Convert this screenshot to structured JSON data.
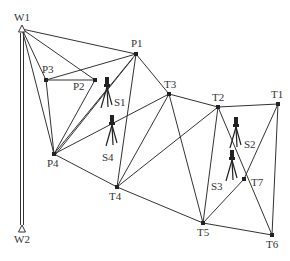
{
  "diagram": {
    "type": "survey-triangulation-network",
    "colors": {
      "line": "#333333",
      "point": "#222222",
      "text": "#333333",
      "background": "#ffffff"
    },
    "benchmarks": [
      {
        "id": "W1",
        "label": "W1",
        "x": 22,
        "y": 29,
        "lx": 14,
        "ly": 21
      },
      {
        "id": "W2",
        "label": "W2",
        "x": 22,
        "y": 229,
        "lx": 14,
        "ly": 243
      }
    ],
    "points": [
      {
        "id": "P1",
        "label": "P1",
        "x": 136,
        "y": 54,
        "lx": 131,
        "ly": 47
      },
      {
        "id": "P2",
        "label": "P2",
        "x": 95,
        "y": 80,
        "lx": 73,
        "ly": 90
      },
      {
        "id": "P3",
        "label": "P3",
        "x": 46,
        "y": 80,
        "lx": 42,
        "ly": 73
      },
      {
        "id": "P4",
        "label": "P4",
        "x": 54,
        "y": 154,
        "lx": 47,
        "ly": 167
      },
      {
        "id": "T1",
        "label": "T1",
        "x": 278,
        "y": 104,
        "lx": 271,
        "ly": 98
      },
      {
        "id": "T2",
        "label": "T2",
        "x": 218,
        "y": 107,
        "lx": 212,
        "ly": 101
      },
      {
        "id": "T3",
        "label": "T3",
        "x": 169,
        "y": 94,
        "lx": 164,
        "ly": 88
      },
      {
        "id": "T4",
        "label": "T4",
        "x": 117,
        "y": 187,
        "lx": 109,
        "ly": 200
      },
      {
        "id": "T5",
        "label": "T5",
        "x": 203,
        "y": 223,
        "lx": 197,
        "ly": 236
      },
      {
        "id": "T6",
        "label": "T6",
        "x": 272,
        "y": 235,
        "lx": 266,
        "ly": 248
      },
      {
        "id": "T7",
        "label": "T7",
        "x": 244,
        "y": 179,
        "lx": 251,
        "ly": 186
      }
    ],
    "stations": [
      {
        "id": "S1",
        "label": "S1",
        "x": 107,
        "y": 84,
        "lx": 114,
        "ly": 106
      },
      {
        "id": "S4",
        "label": "S4",
        "x": 112,
        "y": 122,
        "lx": 102,
        "ly": 161
      },
      {
        "id": "S2",
        "label": "S2",
        "x": 236,
        "y": 124,
        "lx": 244,
        "ly": 148
      },
      {
        "id": "S3",
        "label": "S3",
        "x": 232,
        "y": 157,
        "lx": 211,
        "ly": 190
      }
    ],
    "edges": [
      [
        "W1",
        "W2"
      ],
      [
        "W1",
        "P1"
      ],
      [
        "W1",
        "P2"
      ],
      [
        "W1",
        "P3"
      ],
      [
        "W1",
        "P4"
      ],
      [
        "P3",
        "P1"
      ],
      [
        "P3",
        "P2"
      ],
      [
        "P3",
        "P4"
      ],
      [
        "P2",
        "P4"
      ],
      [
        "P4",
        "P1"
      ],
      [
        "P4",
        "T3"
      ],
      [
        "P4",
        "T4"
      ],
      [
        "P1",
        "T3"
      ],
      [
        "P1",
        "T4"
      ],
      [
        "T3",
        "T2"
      ],
      [
        "T3",
        "T4"
      ],
      [
        "T3",
        "T5"
      ],
      [
        "T2",
        "T1"
      ],
      [
        "T2",
        "T4"
      ],
      [
        "T2",
        "T5"
      ],
      [
        "T2",
        "T6"
      ],
      [
        "T1",
        "T7"
      ],
      [
        "T1",
        "T6"
      ],
      [
        "T7",
        "T5"
      ],
      [
        "T4",
        "T5"
      ],
      [
        "T5",
        "T6"
      ]
    ],
    "extra_edges": [
      {
        "from": [
          54,
          154
        ],
        "to": [
          136,
          54
        ]
      }
    ]
  }
}
